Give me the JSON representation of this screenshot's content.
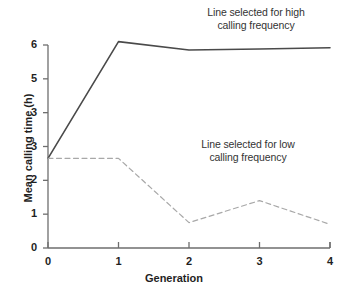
{
  "chart_data": {
    "type": "line",
    "title": "",
    "xlabel": "Generation",
    "ylabel": "Mean calling time (h)",
    "x": [
      0,
      1,
      2,
      3,
      4
    ],
    "xlim": [
      0,
      4
    ],
    "ylim": [
      0,
      6
    ],
    "grid": false,
    "legend_position": "inline-annotations",
    "xticks": [
      "0",
      "1",
      "2",
      "3",
      "4"
    ],
    "yticks": [
      "0",
      "1",
      "2",
      "3",
      "5",
      "6"
    ],
    "ytick_values": [
      0,
      1,
      2,
      3,
      4,
      5,
      6
    ],
    "ytick_labels_as_printed": [
      "0",
      "1",
      "2",
      "3",
      "3",
      "5",
      "6"
    ],
    "series": [
      {
        "name": "Line selected for high calling frequency",
        "style": "solid",
        "color": "#4a4a4a",
        "values": [
          2.65,
          6.1,
          5.85,
          5.88,
          5.92
        ]
      },
      {
        "name": "Line selected for low calling frequency",
        "style": "dashed",
        "color": "#a8a8a8",
        "values": [
          2.65,
          2.65,
          0.75,
          1.4,
          0.7
        ]
      }
    ],
    "annotations": [
      {
        "id": "high",
        "line1": "Line selected for high",
        "line2": "calling frequency"
      },
      {
        "id": "low",
        "line1": "Line selected for low",
        "line2": "calling frequency"
      }
    ]
  },
  "axis": {
    "color": "#6e6e6e"
  }
}
